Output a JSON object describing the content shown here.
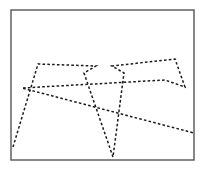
{
  "figure": {
    "background_color": "#ffffff",
    "canvas": {
      "width": 206,
      "height": 169
    },
    "frame": {
      "name": "plot-border",
      "x": 11,
      "y": 10,
      "width": 183,
      "height": 150,
      "stroke_color": "#555555",
      "stroke_width": 1.4,
      "fill_color": "#ffffff"
    },
    "polyline": {
      "name": "dashed-zigzag-path",
      "stroke_color": "#1a1a1a",
      "stroke_width": 1.5,
      "dash_pattern": "2.6 2.2",
      "closed": false,
      "vertex_count": 12,
      "points": [
        [
          13,
          147
        ],
        [
          38,
          64
        ],
        [
          96,
          66
        ],
        [
          84,
          73
        ],
        [
          113,
          157
        ],
        [
          124,
          73
        ],
        [
          112,
          66
        ],
        [
          175,
          59
        ],
        [
          185,
          87
        ],
        [
          165,
          80
        ],
        [
          22,
          88
        ],
        [
          194,
          133
        ]
      ],
      "points_string": "13,147 38,64 96,66 84,73 113,157 124,73 112,66 175,59 185,87 165,80 22,88 194,133"
    },
    "self_intersections": [
      {
        "name": "crossing-lower-left",
        "x": 68,
        "y": 117
      },
      {
        "name": "crossing-center",
        "x": 104,
        "y": 79
      },
      {
        "name": "crossing-lower-right",
        "x": 148,
        "y": 113
      }
    ]
  }
}
